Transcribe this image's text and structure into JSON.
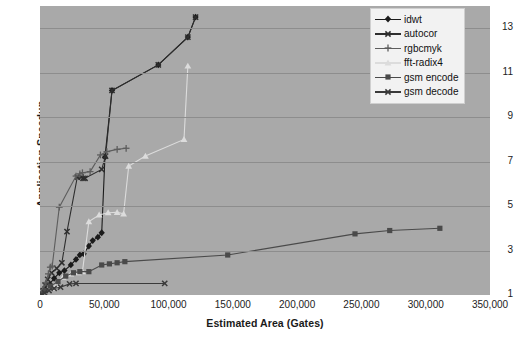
{
  "chart_data": {
    "type": "line",
    "title": "",
    "xlabel": "Estimated Area (Gates)",
    "ylabel": "Application Speedup",
    "xlim": [
      0,
      350000
    ],
    "ylim": [
      1,
      14
    ],
    "xticks": [
      "0",
      "50,000",
      "100,000",
      "150,000",
      "200,000",
      "250,000",
      "300,000",
      "350,000"
    ],
    "xtick_values": [
      0,
      50000,
      100000,
      150000,
      200000,
      250000,
      300000,
      350000
    ],
    "yticks": [
      "1",
      "3",
      "5",
      "7",
      "9",
      "11",
      "13"
    ],
    "ytick_values": [
      1,
      3,
      5,
      7,
      9,
      11,
      13
    ],
    "grid": "horizontal",
    "legend_position": "top-right",
    "plot_background": "#a9a9a9",
    "series": [
      {
        "name": "idwt",
        "color": "#1b1b1b",
        "marker": "diamond",
        "points": [
          [
            1500,
            1.05
          ],
          [
            3000,
            1.15
          ],
          [
            5000,
            1.3
          ],
          [
            7500,
            1.5
          ],
          [
            11000,
            1.75
          ],
          [
            15000,
            2.0
          ],
          [
            19000,
            2.1
          ],
          [
            24000,
            2.35
          ],
          [
            28000,
            2.6
          ],
          [
            31000,
            2.8
          ],
          [
            34000,
            2.85
          ],
          [
            38000,
            3.2
          ],
          [
            41000,
            3.45
          ],
          [
            45000,
            3.6
          ],
          [
            48000,
            3.8
          ],
          [
            50500,
            7.2
          ],
          [
            56000,
            10.2
          ],
          [
            92000,
            11.35
          ],
          [
            115000,
            12.6
          ],
          [
            121000,
            13.5
          ]
        ]
      },
      {
        "name": "autocor",
        "color": "#2e2e2e",
        "marker": "x",
        "points": [
          [
            1200,
            1.05
          ],
          [
            2500,
            1.2
          ],
          [
            4000,
            1.45
          ],
          [
            6000,
            1.7
          ],
          [
            9000,
            2.0
          ],
          [
            13000,
            2.2
          ],
          [
            17000,
            2.45
          ],
          [
            21000,
            3.85
          ],
          [
            29000,
            6.3
          ],
          [
            32000,
            6.3
          ],
          [
            33500,
            6.25
          ],
          [
            35000,
            6.25
          ],
          [
            48000,
            6.65
          ],
          [
            51000,
            7.25
          ],
          [
            56000,
            10.2
          ],
          [
            92000,
            11.35
          ],
          [
            115000,
            12.6
          ],
          [
            121000,
            13.5
          ]
        ]
      },
      {
        "name": "rgbcmyk",
        "color": "#5d5d5d",
        "marker": "plus",
        "points": [
          [
            1000,
            1.05
          ],
          [
            2500,
            1.25
          ],
          [
            4500,
            1.55
          ],
          [
            6500,
            1.95
          ],
          [
            8000,
            2.25
          ],
          [
            9500,
            2.3
          ],
          [
            15000,
            4.95
          ],
          [
            28000,
            6.35
          ],
          [
            31000,
            6.45
          ],
          [
            33000,
            6.5
          ],
          [
            39000,
            6.55
          ],
          [
            47000,
            7.3
          ],
          [
            52000,
            7.45
          ],
          [
            60000,
            7.55
          ],
          [
            67000,
            7.6
          ]
        ]
      },
      {
        "name": "fft-radix4",
        "color": "#dcdcdc",
        "marker": "triangle",
        "points": [
          [
            1200,
            1.0
          ],
          [
            3000,
            1.1
          ],
          [
            6000,
            1.25
          ],
          [
            9000,
            1.3
          ],
          [
            13000,
            1.45
          ],
          [
            18000,
            1.8
          ],
          [
            24000,
            1.95
          ],
          [
            30000,
            2.0
          ],
          [
            33000,
            2.05
          ],
          [
            38000,
            4.3
          ],
          [
            46000,
            4.6
          ],
          [
            53000,
            4.7
          ],
          [
            60000,
            4.72
          ],
          [
            65000,
            4.65
          ],
          [
            69000,
            6.8
          ],
          [
            82000,
            7.25
          ],
          [
            112000,
            8.0
          ],
          [
            115000,
            11.3
          ]
        ]
      },
      {
        "name": "gsm encode",
        "color": "#4a4a4a",
        "marker": "square",
        "points": [
          [
            1500,
            1.05
          ],
          [
            4000,
            1.2
          ],
          [
            8000,
            1.4
          ],
          [
            14000,
            1.6
          ],
          [
            20000,
            1.85
          ],
          [
            26000,
            2.0
          ],
          [
            31000,
            2.05
          ],
          [
            38000,
            2.05
          ],
          [
            48000,
            2.35
          ],
          [
            54000,
            2.4
          ],
          [
            60000,
            2.45
          ],
          [
            66000,
            2.5
          ],
          [
            146000,
            2.8
          ],
          [
            245000,
            3.75
          ],
          [
            272000,
            3.9
          ],
          [
            311000,
            4.0
          ]
        ]
      },
      {
        "name": "gsm decode",
        "color": "#3a3a3a",
        "marker": "x",
        "points": [
          [
            1200,
            1.02
          ],
          [
            3500,
            1.1
          ],
          [
            7000,
            1.2
          ],
          [
            11000,
            1.3
          ],
          [
            16000,
            1.35
          ],
          [
            23000,
            1.5
          ],
          [
            28000,
            1.52
          ],
          [
            97000,
            1.52
          ]
        ]
      }
    ]
  },
  "legend": {
    "items": [
      {
        "label": "idwt",
        "color": "#1b1b1b",
        "marker": "diamond"
      },
      {
        "label": "autocor",
        "color": "#2e2e2e",
        "marker": "x"
      },
      {
        "label": "rgbcmyk",
        "color": "#5d5d5d",
        "marker": "plus"
      },
      {
        "label": "fft-radix4",
        "color": "#dcdcdc",
        "marker": "triangle"
      },
      {
        "label": "gsm encode",
        "color": "#4a4a4a",
        "marker": "square"
      },
      {
        "label": "gsm decode",
        "color": "#3a3a3a",
        "marker": "x"
      }
    ]
  }
}
